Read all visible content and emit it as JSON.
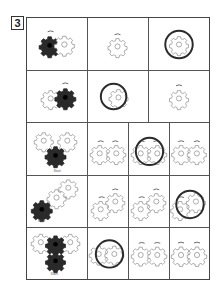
{
  "puzzle": {
    "number": "3",
    "start_label": "Start"
  },
  "colors": {
    "line": "#444444",
    "gear_outline": "#888888",
    "gear_dark": "#222222",
    "circle": "#2a2a2a"
  },
  "rows": [
    {
      "example": "two gears: dark left driving, light right",
      "options": [
        "single gear, rotation arrow",
        "single gear circled"
      ]
    },
    {
      "example": "two gears: light left, dark right driving",
      "options": [
        "single gear circled",
        "single gear, rotation arrow"
      ]
    },
    {
      "example": "three gears: two light top, dark bottom (Start)",
      "options": [
        "two gears with arrows",
        "two gears with arrows, circled",
        "two gears with arrows"
      ]
    },
    {
      "example": "three gears diagonal: dark bottom-left (Start)",
      "options": [
        "two gears staggered",
        "two gears staggered",
        "two gears staggered, circled"
      ]
    },
    {
      "example": "four gears: two light, two dark center (Start)",
      "options": [
        "two gears, circled",
        "two gears with arrows",
        "two gears with arrows"
      ]
    }
  ]
}
